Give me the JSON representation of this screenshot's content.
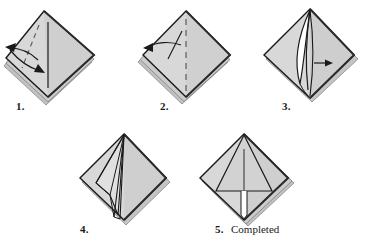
{
  "document": {
    "type": "origami-fold-instructions",
    "background_color": "#ffffff",
    "paper_fill": "#d4d4d4",
    "paper_fill_light": "#dcdcdc",
    "paper_fill_shadow": "#b8b8b8",
    "paper_interior": "#ffffff",
    "line_color": "#1a1a1a",
    "edge_shadow_color": "#6e6e6e"
  },
  "steps": [
    {
      "id": "step-1",
      "label": "1.",
      "caption": "",
      "name": "fold-step-1",
      "description": "Diamond with vertical center line, dashed diagonal crease and double curved arrow pointing left and down-right"
    },
    {
      "id": "step-2",
      "label": "2.",
      "caption": "",
      "name": "fold-step-2",
      "description": "Diamond with dashed vertical center crease and thin arrow pointing to left edge"
    },
    {
      "id": "step-3",
      "label": "3.",
      "caption": "",
      "name": "fold-step-3",
      "description": "Diamond with lifted flap revealing white interior and small arrow pointing right"
    },
    {
      "id": "step-4",
      "label": "4.",
      "caption": "",
      "name": "fold-step-4",
      "description": "Diamond with converging crease lines narrowing to bottom point"
    },
    {
      "id": "step-5",
      "label": "5.",
      "caption": "Completed",
      "name": "fold-step-5",
      "description": "Completed diamond form with inner triangle and vertical center line"
    }
  ]
}
